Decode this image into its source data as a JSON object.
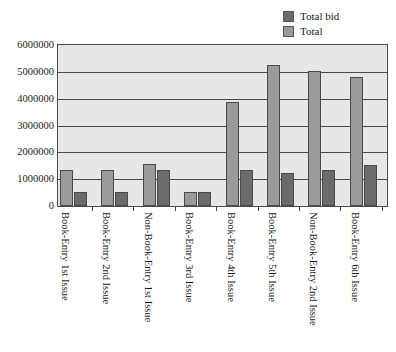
{
  "chart_data": {
    "type": "bar",
    "title": "",
    "xlabel": "",
    "ylabel": "",
    "ylim": [
      0,
      6000000
    ],
    "ytick_step": 1000000,
    "grid": "horizontal",
    "legend_position": "top-right",
    "orientation": "vertical",
    "grouping": "grouped",
    "categories": [
      "Book-Entry 1st Issue",
      "Book-Entry 2nd Issue",
      "Non-Book-Entry 1st Issue",
      "Book-Entry 3rd Issue",
      "Book-Entry 4th Issue",
      "Book-Entry 5th Issue",
      "Non-Book-Entry 2nd Issue",
      "Book-Entry 6th Issue"
    ],
    "ytick_labels": [
      "6000000",
      "5000000",
      "4000000",
      "3000000",
      "2000000",
      "1000000",
      "0"
    ],
    "ytick_values": [
      6000000,
      5000000,
      4000000,
      3000000,
      2000000,
      1000000,
      0
    ],
    "series": [
      {
        "name": "Total",
        "color": "#9a9a9a",
        "plot_order": 0,
        "values": [
          1350000,
          1350000,
          1550000,
          530000,
          3880000,
          5250000,
          5020000,
          4820000
        ]
      },
      {
        "name": "Total bid",
        "color": "#6b6b6b",
        "plot_order": 1,
        "values": [
          530000,
          530000,
          1350000,
          540000,
          1330000,
          1230000,
          1360000,
          1520000
        ]
      }
    ],
    "legend_entries": [
      {
        "label": "Total bid",
        "color": "#6b6b6b"
      },
      {
        "label": "Total",
        "color": "#9a9a9a"
      }
    ]
  },
  "style": {
    "plot_background": "#e7e7e7",
    "axis_color": "#4a4a4a",
    "page_background": "#ffffff",
    "text_color": "#1a1a1a"
  }
}
